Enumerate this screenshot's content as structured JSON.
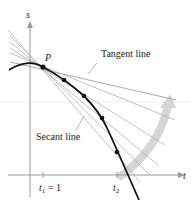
{
  "figure": {
    "axes": {
      "x_label": "t",
      "y_label": "s"
    },
    "point_label": "P",
    "annotations": {
      "tangent": "Tangent line",
      "secant": "Secant line"
    },
    "ticks": {
      "t1_var": "t",
      "t1_sub": "1",
      "t1_eq": " = 1",
      "t2_var": "t",
      "t2_sub": "2"
    },
    "colors": {
      "curve": "#111111",
      "axis": "#999999",
      "secant_lines": "#aaaaaa",
      "arrow": "#d4d4d4",
      "text": "#222222"
    }
  }
}
